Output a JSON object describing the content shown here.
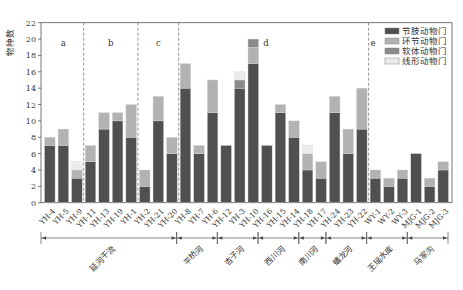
{
  "chart_data": {
    "type": "bar",
    "stacked": true,
    "title": "",
    "xlabel": "",
    "ylabel": "物种数",
    "ylim": [
      0,
      22
    ],
    "yticks": [
      0,
      2,
      4,
      6,
      8,
      10,
      12,
      14,
      16,
      18,
      20,
      22
    ],
    "grid": false,
    "legend_position": "upper right",
    "categories": [
      "YH-4",
      "YH-5",
      "YH-9",
      "YH-11",
      "YH-13",
      "YH-19",
      "YH-1",
      "YH-2",
      "YH-21",
      "YH-20",
      "YH-8",
      "YH-7",
      "YH-6",
      "YH-12",
      "YH-3",
      "YH-10",
      "YH-16",
      "YH-15",
      "YH-14",
      "YH-18",
      "YH-17",
      "YH-24",
      "YH-23",
      "YH-22",
      "WY-1",
      "WY-2",
      "WY-3",
      "MJG-1",
      "MJG-2",
      "MJG-3"
    ],
    "series": [
      {
        "name": "节肢动物门",
        "color": "#505050",
        "values": [
          7,
          7,
          3,
          5,
          9,
          10,
          8,
          2,
          10,
          6,
          14,
          6,
          11,
          7,
          14,
          17,
          7,
          11,
          8,
          4,
          3,
          11,
          6,
          9,
          3,
          2,
          3,
          6,
          2,
          4
        ]
      },
      {
        "name": "环节动物门",
        "color": "#b2b2b2",
        "values": [
          1,
          2,
          1,
          2,
          2,
          1,
          4,
          2,
          3,
          2,
          3,
          1,
          4,
          0,
          0,
          2,
          0,
          1,
          2,
          2,
          2,
          2,
          3,
          5,
          1,
          1,
          1,
          0,
          1,
          1
        ]
      },
      {
        "name": "软体动物门",
        "color": "#8a8a8a",
        "values": [
          0,
          0,
          0,
          0,
          0,
          0,
          0,
          0,
          0,
          0,
          0,
          0,
          0,
          0,
          1,
          1,
          0,
          0,
          0,
          0,
          0,
          0,
          0,
          0,
          0,
          0,
          0,
          0,
          0,
          0
        ]
      },
      {
        "name": "线形动物门",
        "color": "#ececec",
        "values": [
          0,
          0,
          1,
          0,
          0,
          0,
          0,
          0,
          0,
          0,
          0,
          0,
          0,
          0,
          1,
          0,
          0,
          0,
          0,
          1,
          0,
          0,
          0,
          0,
          0,
          0,
          0,
          0,
          0,
          0
        ]
      }
    ],
    "panels": [
      {
        "label": "a",
        "from": 0,
        "to": 2
      },
      {
        "label": "b",
        "from": 3,
        "to": 6
      },
      {
        "label": "c",
        "from": 7,
        "to": 9
      },
      {
        "label": "d",
        "from": 10,
        "to": 23
      },
      {
        "label": "e",
        "from": 24,
        "to": 29
      }
    ],
    "groups": [
      {
        "name": "延河干流",
        "from": 0,
        "to": 9
      },
      {
        "name": "平桥河",
        "from": 10,
        "to": 12
      },
      {
        "name": "杏子河",
        "from": 13,
        "to": 15
      },
      {
        "name": "西川河",
        "from": 16,
        "to": 18
      },
      {
        "name": "南川河",
        "from": 19,
        "to": 20
      },
      {
        "name": "蟠龙河",
        "from": 21,
        "to": 23
      },
      {
        "name": "王瑶水库",
        "from": 24,
        "to": 26
      },
      {
        "name": "马家沟",
        "from": 27,
        "to": 29
      }
    ]
  }
}
